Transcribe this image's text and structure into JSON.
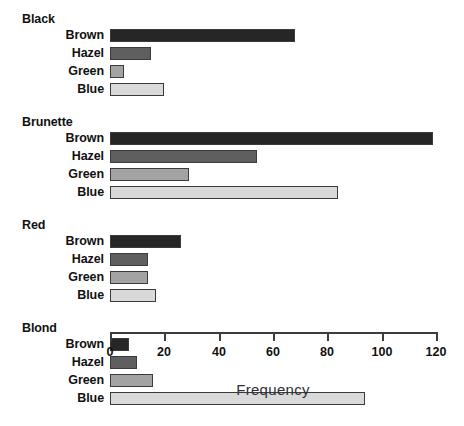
{
  "chart_data": {
    "type": "bar",
    "orientation": "horizontal",
    "title": "",
    "xlabel": "Frequency",
    "ylabel": "",
    "xlim": [
      0,
      120
    ],
    "xticks": [
      0,
      20,
      40,
      60,
      80,
      100,
      120
    ],
    "xtick_labels": [
      "0",
      "20",
      "40",
      "60",
      "80",
      "100",
      "120"
    ],
    "grid": false,
    "legend": "none",
    "categories": [
      "Brown",
      "Hazel",
      "Green",
      "Blue"
    ],
    "groups": [
      {
        "name": "Black",
        "bars": [
          {
            "label": "Brown",
            "value": 68,
            "color": "#262626"
          },
          {
            "label": "Hazel",
            "value": 15,
            "color": "#5f5f5f"
          },
          {
            "label": "Green",
            "value": 5,
            "color": "#a3a3a3"
          },
          {
            "label": "Blue",
            "value": 20,
            "color": "#d9d9d9"
          }
        ]
      },
      {
        "name": "Brunette",
        "bars": [
          {
            "label": "Brown",
            "value": 119,
            "color": "#262626"
          },
          {
            "label": "Hazel",
            "value": 54,
            "color": "#5f5f5f"
          },
          {
            "label": "Green",
            "value": 29,
            "color": "#a3a3a3"
          },
          {
            "label": "Blue",
            "value": 84,
            "color": "#d9d9d9"
          }
        ]
      },
      {
        "name": "Red",
        "bars": [
          {
            "label": "Brown",
            "value": 26,
            "color": "#262626"
          },
          {
            "label": "Hazel",
            "value": 14,
            "color": "#5f5f5f"
          },
          {
            "label": "Green",
            "value": 14,
            "color": "#a3a3a3"
          },
          {
            "label": "Blue",
            "value": 17,
            "color": "#d9d9d9"
          }
        ]
      },
      {
        "name": "Blond",
        "bars": [
          {
            "label": "Brown",
            "value": 7,
            "color": "#262626"
          },
          {
            "label": "Hazel",
            "value": 10,
            "color": "#5f5f5f"
          },
          {
            "label": "Green",
            "value": 16,
            "color": "#a3a3a3"
          },
          {
            "label": "Blue",
            "value": 94,
            "color": "#d9d9d9"
          }
        ]
      }
    ],
    "colors": {
      "axis": "#3c3c3c",
      "bar_border": "#3b3b3b",
      "text": "#111111",
      "axis_title": "#2e2e38",
      "background": "#ffffff"
    }
  }
}
